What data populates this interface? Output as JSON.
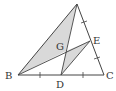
{
  "diagram": {
    "type": "geometry-triangle",
    "colors": {
      "line": "#444444",
      "fill": "#d9d9d9",
      "background": "#ffffff"
    },
    "points": {
      "A": {
        "label": "A",
        "x": 77,
        "y": 4
      },
      "B": {
        "label": "B",
        "x": 18,
        "y": 75
      },
      "C": {
        "label": "C",
        "x": 104,
        "y": 75
      },
      "D": {
        "label": "D",
        "x": 61,
        "y": 75
      },
      "E": {
        "label": "E",
        "x": 90,
        "y": 41
      },
      "G": {
        "label": "G",
        "x": 66,
        "y": 51
      }
    },
    "labels": {
      "B": "B",
      "C": "C",
      "D": "D",
      "E": "E",
      "G": "G"
    },
    "shaded_regions": [
      "triangle A-B-G",
      "triangle G-D-E"
    ],
    "segments": [
      "AB",
      "BC",
      "CA",
      "AD",
      "BE",
      "DE"
    ],
    "tick_marks": [
      "BD",
      "DC",
      "AE",
      "EC"
    ]
  }
}
